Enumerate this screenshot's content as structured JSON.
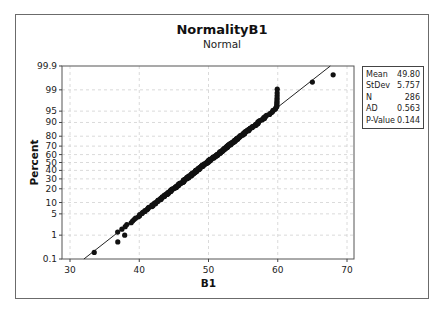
{
  "chart_data": {
    "type": "scatter",
    "subtype": "normal-probability-plot",
    "title": "NormalityB1",
    "subtitle": "Normal",
    "xlabel": "B1",
    "ylabel": "Percent",
    "x_ticks": [
      30,
      40,
      50,
      60,
      70
    ],
    "xlim": [
      29,
      71
    ],
    "y_ticks": [
      0.1,
      1,
      5,
      10,
      20,
      30,
      40,
      50,
      60,
      70,
      80,
      90,
      95,
      99,
      99.9
    ],
    "y_tick_labels": [
      "0.1",
      "1",
      "5",
      "10",
      "20",
      "30",
      "40",
      "50",
      "60",
      "70",
      "80",
      "90",
      "95",
      "99",
      "99.9"
    ],
    "ylim": [
      0.1,
      99.9
    ],
    "y_scale": "normal-probability",
    "grid": true,
    "fit_line": {
      "distribution": "normal",
      "mean": 49.8,
      "stdev": 5.757
    },
    "stats": [
      {
        "label": "Mean",
        "value": "49.80"
      },
      {
        "label": "StDev",
        "value": "5.757"
      },
      {
        "label": "N",
        "value": "286"
      },
      {
        "label": "AD",
        "value": "0.563"
      },
      {
        "label": "P-Value",
        "value": "0.144"
      }
    ],
    "points_summary": "286 observations; dense band from ~39.5 to ~60 roughly following the fitted line, lower outliers near 33.5, 37, 37.5, 38 and upper outliers near 65 and 68; values cap near 60 producing a vertical stack from ~85% to ~99%",
    "notable_points": [
      {
        "x": 33.5,
        "percent": 0.2
      },
      {
        "x": 36.9,
        "percent": 0.55
      },
      {
        "x": 37.4,
        "percent": 0.8
      },
      {
        "x": 37.9,
        "percent": 1.0
      },
      {
        "x": 39.2,
        "percent": 1.5
      },
      {
        "x": 39.6,
        "percent": 2.0
      },
      {
        "x": 59.8,
        "percent": 90
      },
      {
        "x": 60.0,
        "percent": 99.0
      },
      {
        "x": 65.0,
        "percent": 99.5
      },
      {
        "x": 68.0,
        "percent": 99.75
      }
    ],
    "legend_position": "right"
  }
}
